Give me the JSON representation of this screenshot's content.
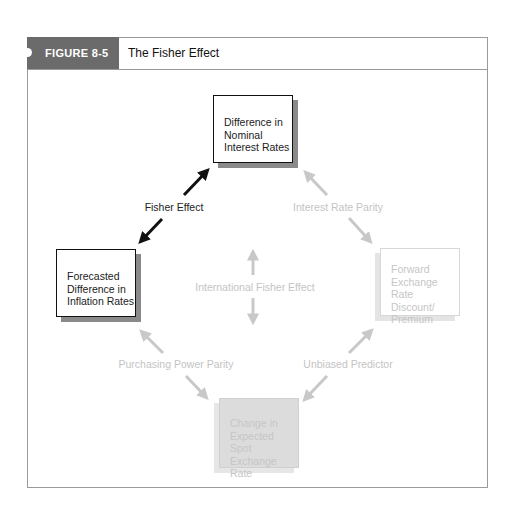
{
  "figure": {
    "number_label": "FIGURE 8-5",
    "title": "The Fisher Effect",
    "tab_color": "#6b6b6b"
  },
  "nodes": {
    "top": {
      "text": "Difference in Nominal Interest Rates",
      "lines": [
        "Difference in",
        "Nominal",
        "Interest Rates"
      ],
      "style": "emphasized"
    },
    "left": {
      "text": "Forecasted Difference in Inflation Rates",
      "lines": [
        "Forecasted",
        "Difference in",
        "Inflation Rates"
      ],
      "style": "emphasized"
    },
    "right": {
      "text": "Forward Exchange Rate Discount/ Premium",
      "lines": [
        "Forward",
        "Exchange Rate",
        "Discount/",
        "Premium"
      ],
      "style": "faded"
    },
    "bottom": {
      "text": "Change in Expected Spot Exchange Rate",
      "lines": [
        "Change in",
        "Expected Spot",
        "Exchange Rate"
      ],
      "style": "faded-filled"
    }
  },
  "relations": {
    "fisher_effect": {
      "label": "Fisher Effect",
      "from": "left",
      "to": "top",
      "style": "emphasized"
    },
    "interest_rate_parity": {
      "label": "Interest Rate Parity",
      "from": "top",
      "to": "right",
      "style": "faded"
    },
    "international_fisher_effect": {
      "label": "International Fisher Effect",
      "from": "top",
      "to": "bottom",
      "style": "faded"
    },
    "purchasing_power_parity": {
      "label": "Purchasing Power Parity",
      "from": "left",
      "to": "bottom",
      "style": "faded"
    },
    "unbiased_predictor": {
      "label": "Unbiased Predictor",
      "from": "right",
      "to": "bottom",
      "style": "faded"
    }
  },
  "colors": {
    "emphasized": "#111111",
    "faded": "#c8c8c8"
  }
}
